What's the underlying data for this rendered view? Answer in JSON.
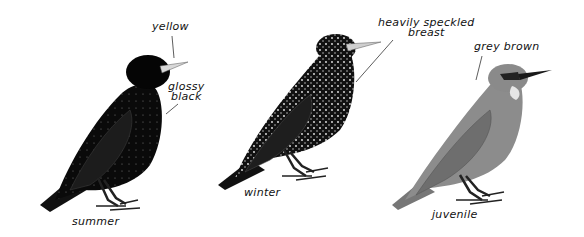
{
  "figure": {
    "birds": [
      {
        "id": "summer",
        "caption": "summer",
        "annotations": [
          {
            "text": "yellow",
            "target": "bill"
          },
          {
            "text_line1": "glossy",
            "text_line2": "black",
            "target": "body"
          }
        ],
        "colors": {
          "body": "#0a0a0a",
          "bill": "#d8d8d8"
        }
      },
      {
        "id": "winter",
        "caption": "winter",
        "annotations": [
          {
            "text_line1": "heavily speckled",
            "text_line2": "breast",
            "target": "breast"
          }
        ],
        "colors": {
          "body": "#111111",
          "speckle": "#e8e8e8",
          "bill": "#cfcfcf"
        }
      },
      {
        "id": "juvenile",
        "caption": "juvenile",
        "annotations": [
          {
            "text": "grey brown",
            "target": "head"
          }
        ],
        "colors": {
          "body": "#8a8a8a",
          "wing": "#6e6e6e",
          "throat": "#e6e6e6",
          "bill": "#1a1a1a"
        }
      }
    ]
  }
}
